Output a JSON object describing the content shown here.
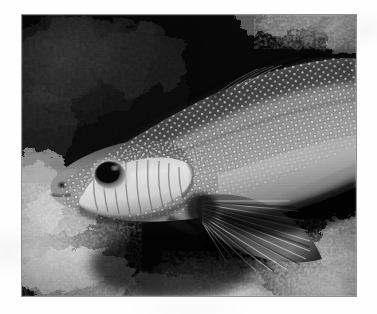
{
  "page": {
    "background_color": "#fefefe",
    "width": 377,
    "height": 314
  },
  "photo": {
    "name": "underwater-fish-photograph",
    "alt_text": "Black and white underwater photograph of a spotted fish resting on coral",
    "color_mode": "grayscale",
    "frame": {
      "x": 22,
      "y": 15,
      "width": 334,
      "height": 281,
      "border_color": "#8c8c8c",
      "background_color": "#050505"
    },
    "palette": {
      "deep_shadow": "#060606",
      "dark_rock": "#1b1b1b",
      "mid_grey": "#6e6e6e",
      "body_grey": "#8a8a8a",
      "highlight": "#d8d8d8",
      "bright_white": "#f2f2f2"
    },
    "subject": {
      "label": "spotted fish",
      "common_name": "Spotted grouper",
      "orientation": "facing left",
      "features": [
        "dark round eye with pale iris ring",
        "white speckled spots across head and body",
        "striated bright gill cover and cheek",
        "radiating pectoral fin rays",
        "blunt snout and small mouth"
      ]
    },
    "background": {
      "label": "coral reef and dark rock crevice",
      "regions": [
        "dark mottled rock upper left",
        "bright coral rubble lower left",
        "bright coral rubble lower right",
        "deep shadow crevice centre right",
        "light coral texture top right"
      ]
    }
  }
}
